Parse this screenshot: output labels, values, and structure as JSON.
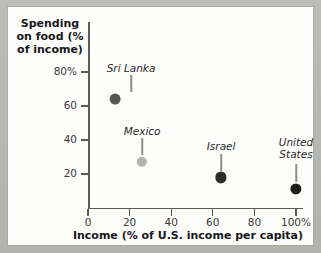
{
  "chart_data": {
    "type": "scatter",
    "title": "",
    "xlabel": "Income (% of U.S. income per capita)",
    "ylabel": "Spending on food (% of income)",
    "xlim": [
      0,
      110
    ],
    "ylim": [
      0,
      88
    ],
    "grid": false,
    "legend": "none",
    "x_ticks": [
      "0",
      "20",
      "40",
      "60",
      "80",
      "100%"
    ],
    "x_tick_values": [
      0,
      20,
      40,
      60,
      80,
      100
    ],
    "y_ticks": [
      "20",
      "40",
      "60",
      "80%"
    ],
    "y_tick_values": [
      20,
      40,
      60,
      80
    ],
    "points": [
      {
        "label": "Sri Lanka",
        "x": 13,
        "y": 64,
        "color": "#555553",
        "radius": 5.4,
        "label_lines": [
          "Sri Lanka"
        ],
        "label_dx": 16,
        "label_y_value": 82,
        "leader_from": 78,
        "leader_to": 68
      },
      {
        "label": "Mexico",
        "x": 26,
        "y": 27,
        "color": "#b3b3b1",
        "radius": 5.2,
        "label_lines": [
          "Mexico"
        ],
        "label_dx": 0,
        "label_y_value": 45,
        "leader_from": 41,
        "leader_to": 31
      },
      {
        "label": "Israel",
        "x": 64,
        "y": 18,
        "color": "#2b2b29",
        "radius": 5.6,
        "label_lines": [
          "Israel"
        ],
        "label_dx": 0,
        "label_y_value": 36,
        "leader_from": 32,
        "leader_to": 22
      },
      {
        "label": "United States",
        "x": 100,
        "y": 11,
        "color": "#1e1e1c",
        "radius": 5.6,
        "label_lines": [
          "United",
          "States"
        ],
        "label_dx": 0,
        "label_y_value": 38,
        "leader_from": 26,
        "leader_to": 15
      }
    ]
  },
  "colors": {
    "axis": "#5a5a58",
    "text": "#17171a",
    "paper": "#fdfdfc",
    "backdrop": "#b9b9b4"
  }
}
